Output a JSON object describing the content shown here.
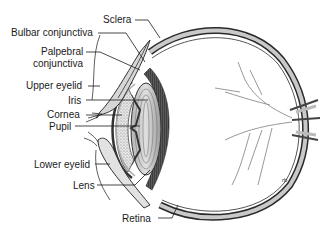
{
  "diagram": {
    "labels": {
      "sclera": "Sclera",
      "bulbar_conjunctiva": "Bulbar conjunctiva",
      "palpebral_conjunctiva_1": "Palpebral",
      "palpebral_conjunctiva_2": "conjunctiva",
      "upper_eyelid": "Upper eyelid",
      "iris": "Iris",
      "cornea": "Cornea",
      "pupil": "Pupil",
      "lower_eyelid": "Lower eyelid",
      "lens": "Lens",
      "retina": "Retina"
    },
    "colors": {
      "background": "#ffffff",
      "ink": "#1a1a1a",
      "shade_dark": "#3a3a3a",
      "shade_mid": "#8a8a8a",
      "shade_light": "#cfcfcf"
    }
  }
}
